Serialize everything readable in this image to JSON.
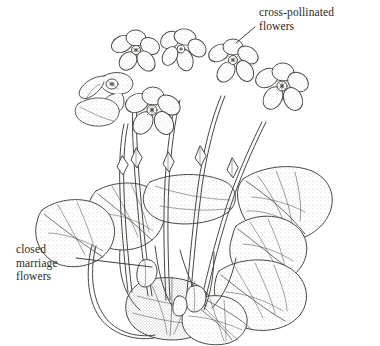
{
  "figure": {
    "background_color": "#ffffff",
    "ink_color": "#4a4742",
    "text_color": "#2b2724",
    "width": 380,
    "height": 346
  },
  "labels": {
    "cross_pollinated": {
      "text": "cross-pollinated\nflowers",
      "line1": "cross-pollinated",
      "line2": "flowers"
    },
    "closed_marriage": {
      "text": "closed\nmarriage\nflowers",
      "line1": "closed",
      "line2": "marriage",
      "line3": "flowers"
    }
  },
  "leader_lines": {
    "cross_pollinated": "diagonal leader from label down-left to upper flower",
    "closed_marriage": "horizontal leader from label right to closed bud at plant base"
  },
  "parts": {
    "cross_pollinated_flowers": "five-petalled open violet flowers on long curved peduncles",
    "closed_marriage_flowers": "small closed cleistogamous buds near the plant base",
    "leaves": "heart-shaped scalloped basal leaves with stippled shading",
    "stems": "slender stems bearing small bracts"
  }
}
